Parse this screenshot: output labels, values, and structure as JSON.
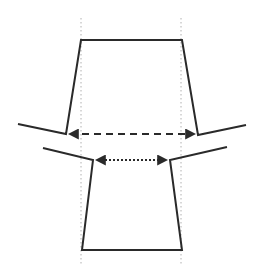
{
  "diagram": {
    "title": "",
    "colors": {
      "stroke": "#2a2a2a",
      "guide": "#b0b0b0",
      "background": "#ffffff"
    },
    "guides": [
      {
        "x": 81,
        "y1": 18,
        "y2": 266
      },
      {
        "x": 181,
        "y1": 18,
        "y2": 266
      }
    ],
    "upper_shape": {
      "points": "18,124 66,134 81,40 182,40 198,135 246,125"
    },
    "lower_shape": {
      "points": "43,148 93,160 82,250 182,250 170,160 227,147"
    },
    "upper_arrow": {
      "x1": 70,
      "x2": 194,
      "y": 134,
      "style": "dashed"
    },
    "lower_arrow": {
      "x1": 97,
      "x2": 166,
      "y": 160,
      "style": "dotted"
    }
  }
}
